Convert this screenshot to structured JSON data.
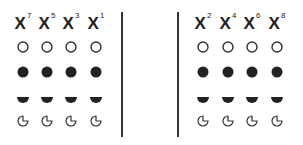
{
  "diagram": {
    "groups": [
      {
        "name": "left",
        "columns": [
          {
            "base": "X",
            "exponent": "7"
          },
          {
            "base": "X",
            "exponent": "5"
          },
          {
            "base": "X",
            "exponent": "3"
          },
          {
            "base": "X",
            "exponent": "1"
          }
        ]
      },
      {
        "name": "right",
        "columns": [
          {
            "base": "X",
            "exponent": "2"
          },
          {
            "base": "X",
            "exponent": "4"
          },
          {
            "base": "X",
            "exponent": "6"
          },
          {
            "base": "X",
            "exponent": "8"
          }
        ]
      }
    ],
    "symbol_rows": [
      "open-circle",
      "filled-circle",
      "half-circle",
      "pacman-circle"
    ],
    "divider_count": 2,
    "colors": {
      "ink": "#222222",
      "background": "#ffffff"
    }
  }
}
